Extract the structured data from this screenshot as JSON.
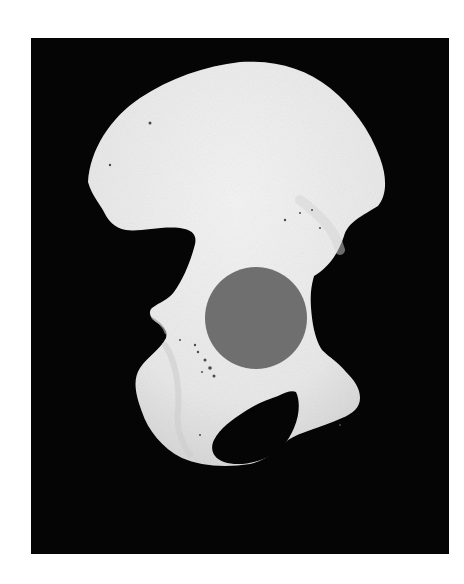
{
  "image": {
    "subject": "hip bone (os coxae) photograph with acetabulum masked",
    "background_color": "#ffffff",
    "photo_background_color": "#050505",
    "bone_color": "#ebebeb",
    "bone_shadow_color": "#cfcfcf",
    "foramen_color": "#050505",
    "marker": {
      "shape": "circle",
      "color": "#6f6f6f",
      "cx": 256,
      "cy": 318,
      "r": 51
    },
    "frame": {
      "x": 31,
      "y": 38,
      "width": 418,
      "height": 516
    }
  }
}
